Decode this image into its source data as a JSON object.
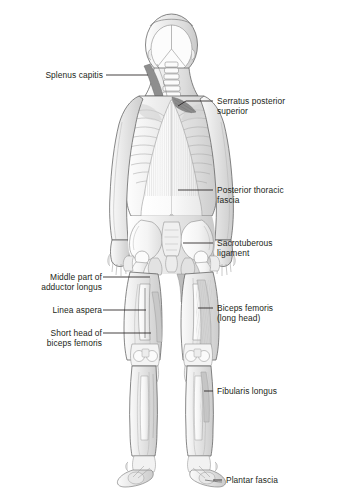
{
  "figure": {
    "view": "posterior",
    "background_color": "#ffffff",
    "line_color": "#231f20",
    "fill_light": "#f2f2f2",
    "fill_mid": "#d9d9d9",
    "fill_dark": "#9a9a9a"
  },
  "labels": {
    "splenus_capitis": "Splenus capitis",
    "serratus_posterior_superior": "Serratus posterior\nsuperior",
    "posterior_thoracic_fascia": "Posterior thoracic\nfascia",
    "sacrotuberous_ligament": "Sacrotuberous\nligament",
    "middle_part_adductor_longus": "Middle part of\nadductor longus",
    "linea_aspera": "Linea aspera",
    "biceps_femoris_long_head": "Biceps femoris\n(long head)",
    "short_head_biceps_femoris": "Short head of\nbiceps femoris",
    "fibularis_longus": "Fibularis longus",
    "plantar_fascia": "Plantar fascia"
  }
}
